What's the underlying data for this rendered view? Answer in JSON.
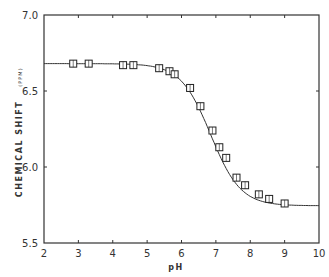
{
  "chart_data": {
    "type": "scatter",
    "title": "",
    "xlabel": "pH",
    "ylabel": "CHEMICAL SHIFT",
    "ylabel_unit": "(PPM)",
    "xlim": [
      2,
      10
    ],
    "ylim": [
      5.5,
      7.0
    ],
    "xticks": [
      2,
      3,
      4,
      5,
      6,
      7,
      8,
      9,
      10
    ],
    "yticks": [
      5.5,
      6.0,
      6.5,
      7.0
    ],
    "xtick_labels": [
      "2",
      "3",
      "4",
      "5",
      "6",
      "7",
      "8",
      "9",
      "10"
    ],
    "ytick_labels": [
      "5.5",
      "6.0",
      "6.5",
      "7.0"
    ],
    "grid": false,
    "legend": null,
    "series": [
      {
        "name": "observed",
        "marker": "square",
        "x": [
          2.85,
          3.3,
          4.3,
          4.6,
          5.35,
          5.65,
          5.8,
          6.25,
          6.55,
          6.9,
          7.1,
          7.3,
          7.6,
          7.85,
          8.25,
          8.55,
          9.0
        ],
        "y": [
          6.68,
          6.68,
          6.67,
          6.67,
          6.65,
          6.63,
          6.61,
          6.52,
          6.4,
          6.24,
          6.13,
          6.06,
          5.93,
          5.88,
          5.82,
          5.79,
          5.76
        ]
      },
      {
        "name": "fitted titration curve",
        "type": "line",
        "high_limit": 6.68,
        "low_limit": 5.745,
        "pKa": 6.85
      }
    ]
  }
}
